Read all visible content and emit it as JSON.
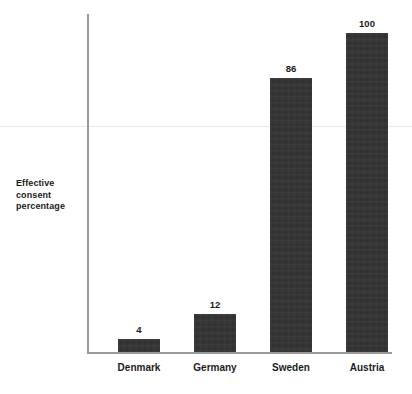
{
  "chart_data": {
    "type": "bar",
    "title": "",
    "subtitle": "",
    "xlabel": "",
    "ylabel": "Effective consent percentage",
    "ylabel_lines": [
      "Effective",
      "consent",
      "percentage"
    ],
    "categories": [
      "Denmark",
      "Germany",
      "Sweden",
      "Austria"
    ],
    "values": [
      4,
      12,
      86,
      100
    ],
    "value_labels": [
      "4",
      "12",
      "86",
      "100"
    ],
    "ylim": [
      0,
      106
    ],
    "grid": false,
    "legend": false,
    "legend_position": "none",
    "bar_color": "#333333",
    "axis_color": "#9a9a9a",
    "text_color": "#1b1b1b",
    "annotations": []
  }
}
